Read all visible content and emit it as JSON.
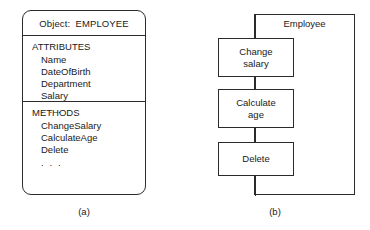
{
  "figure": {
    "panel_a": {
      "caption": "(a)",
      "card": {
        "header": "Object:  EMPLOYEE",
        "attributes_section": {
          "title": "ATTRIBUTES",
          "items": [
            "Name",
            "DateOfBirth",
            "Department",
            "Salary"
          ],
          "ellipsis": ". . ."
        },
        "methods_section": {
          "title": "METHODS",
          "items": [
            "ChangeSalary",
            "CalculateAge",
            "Delete"
          ],
          "ellipsis": ". . ."
        }
      }
    },
    "panel_b": {
      "caption": "(b)",
      "frame_label": "Employee",
      "operations": [
        {
          "line1": "Change",
          "line2": "salary"
        },
        {
          "line1": "Calculate",
          "line2": "age"
        },
        {
          "line1": "Delete",
          "line2": ""
        }
      ]
    }
  },
  "colors": {
    "stroke": "#2b2b2b",
    "background": "#ffffff",
    "text": "#1a1a1a"
  }
}
